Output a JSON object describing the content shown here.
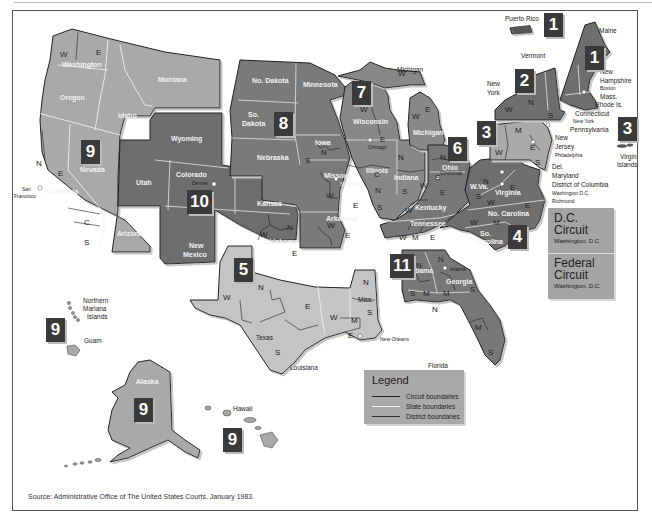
{
  "colors": {
    "circuit_box": "#3a3a3a",
    "dark_region": "#6e6e6e",
    "mid_region": "#8a8a8a",
    "light_region": "#a9a9a9",
    "lighter_region": "#c4c4c4",
    "legend_bg": "#a9a9a9",
    "frame": "#555555"
  },
  "circuits": [
    {
      "number": "1",
      "label": "1",
      "x": 428,
      "y": 14
    },
    {
      "number": "1",
      "label": "1",
      "x": 590,
      "y": 36
    },
    {
      "number": "2",
      "label": "2",
      "x": 515,
      "y": 70
    },
    {
      "number": "3",
      "label": "3",
      "x": 477,
      "y": 120
    },
    {
      "number": "3",
      "label": "3",
      "x": 618,
      "y": 117
    },
    {
      "number": "4",
      "label": "4",
      "x": 508,
      "y": 226
    },
    {
      "number": "5",
      "label": "5",
      "x": 234,
      "y": 257
    },
    {
      "number": "6",
      "label": "6",
      "x": 448,
      "y": 136
    },
    {
      "number": "7",
      "label": "7",
      "x": 352,
      "y": 80
    },
    {
      "number": "8",
      "label": "8",
      "x": 274,
      "y": 113
    },
    {
      "number": "9",
      "label": "9",
      "x": 81,
      "y": 140
    },
    {
      "number": "9",
      "label": "9",
      "x": 47,
      "y": 318
    },
    {
      "number": "9",
      "label": "9",
      "x": 136,
      "y": 399
    },
    {
      "number": "9",
      "label": "9",
      "x": 224,
      "y": 428
    },
    {
      "number": "10",
      "label": "10",
      "x": 187,
      "y": 190
    },
    {
      "number": "11",
      "label": "11",
      "x": 390,
      "y": 254
    }
  ],
  "states": {
    "washington": "Washington",
    "oregon": "Oregon",
    "idaho": "Idaho",
    "montana": "Montana",
    "nevada": "Nevada",
    "california": "California",
    "arizona": "Arizona",
    "utah": "Utah",
    "wyoming": "Wyoming",
    "colorado": "Colorado",
    "new_mexico_1": "New",
    "new_mexico_2": "Mexico",
    "no_dakota": "No. Dakota",
    "so_dakota_1": "So.",
    "so_dakota_2": "Dakota",
    "nebraska": "Nebraska",
    "kansas": "Kansas",
    "oklahoma": "Oklahoma",
    "minnesota": "Minnesota",
    "iowa": "Iowa",
    "missouri": "Missouri",
    "arkansas": "Arkansas",
    "texas": "Texas",
    "louisiana": "Louisiana",
    "miss": "Miss.",
    "wisconsin": "Wisconsin",
    "illinois": "Illinois",
    "indiana": "Indiana",
    "michigan": "Michigan",
    "michigan_up": "Michigan",
    "ohio": "Ohio",
    "kentucky": "Kentucky",
    "tennessee": "Tennessee",
    "alabama": "Alabama",
    "georgia": "Georgia",
    "florida": "Florida",
    "wva": "W.Va.",
    "virginia": "Virginia",
    "no_carolina": "No. Carolina",
    "so_carolina_1": "So.",
    "so_carolina_2": "Carolina",
    "alaska": "Alaska",
    "hawaii": "Hawaii",
    "guam": "Guam",
    "nmi_1": "Northern",
    "nmi_2": "Mariana",
    "nmi_3": "Islands",
    "puerto_rico": "Puerto Rico",
    "virgin_1": "Virgin",
    "virgin_2": "Islands",
    "maine": "Maine",
    "vermont": "Vermont",
    "new_york_1": "New",
    "new_york_2": "York",
    "new_hampshire_1": "New",
    "new_hampshire_2": "Hampshire",
    "mass": "Mass.",
    "rhode": "Rhode Is.",
    "connecticut": "Connecticut",
    "pennsylvania": "Pennsylvania",
    "new_jersey_1": "New",
    "new_jersey_2": "Jersey",
    "del": "Del.",
    "maryland": "Maryland",
    "dc": "District of Columbia"
  },
  "cities": {
    "san_francisco_1": "San",
    "san_francisco_2": "Francisco",
    "denver": "Denver",
    "st_louis": "St. Louis",
    "chicago": "Chicago",
    "cincinnati": "Cincinnati",
    "new_orleans": "New Orleans",
    "atlanta": "Atlanta",
    "boston": "Boston",
    "new_york_city": "New York",
    "philadelphia": "Philadelphia",
    "washington_dc": "Washington D.C.",
    "richmond": "Richmond"
  },
  "districts": {
    "W": "W",
    "E": "E",
    "N": "N",
    "S": "S",
    "C": "C",
    "M": "M"
  },
  "dc_box": {
    "dc_circuit_1": "D.C.",
    "dc_circuit_2": "Circuit",
    "dc_location": "Washington, D.C.",
    "fed_circuit_1": "Federal",
    "fed_circuit_2": "Circuit",
    "fed_location": "Washington, D.C."
  },
  "legend": {
    "title": "Legend",
    "items": [
      {
        "label": "Circuit boundaries",
        "color": "#222222",
        "width": 1.4
      },
      {
        "label": "State boundaries",
        "color": "#f2f2f2",
        "width": 1.4
      },
      {
        "label": "District boundaries",
        "color": "#333333",
        "width": 0.7
      }
    ]
  },
  "source": "Source: Administrative Office of The United States Courts, January 1983."
}
